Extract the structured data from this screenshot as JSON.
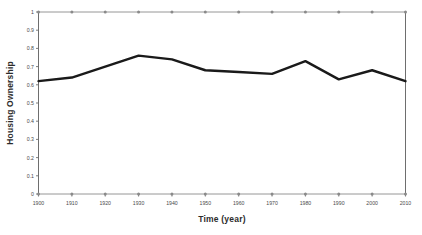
{
  "chart_data": {
    "type": "line",
    "title": "",
    "xlabel": "Time (year)",
    "ylabel": "Housing Ownership",
    "x": [
      1900,
      1910,
      1920,
      1930,
      1940,
      1950,
      1960,
      1970,
      1980,
      1990,
      2000,
      2010
    ],
    "xtick_labels": [
      "1900",
      "1910",
      "1920",
      "1930",
      "1940",
      "1950",
      "1960",
      "1970",
      "1980",
      "1990",
      "2000",
      "2010"
    ],
    "ytick_labels": [
      "0",
      "0.1",
      "0.2",
      "0.3",
      "0.4",
      "0.5",
      "0.6",
      "0.7",
      "0.8",
      "0.9",
      "1"
    ],
    "ytick_values": [
      0,
      0.1,
      0.2,
      0.3,
      0.4,
      0.5,
      0.6,
      0.7,
      0.8,
      0.9,
      1
    ],
    "xlim": [
      1900,
      2010
    ],
    "ylim": [
      0,
      1
    ],
    "grid": false,
    "legend": "none",
    "series": [
      {
        "name": "Housing Ownership",
        "color": "#1a1a1a",
        "values": [
          0.62,
          0.64,
          0.7,
          0.76,
          0.74,
          0.68,
          0.67,
          0.66,
          0.73,
          0.63,
          0.68,
          0.62
        ]
      },
      {
        "name": "upper-reference",
        "color": "#8a8a8a",
        "values": [
          1,
          1,
          1,
          1,
          1,
          1,
          1,
          1,
          1,
          1,
          1,
          1
        ]
      },
      {
        "name": "lower-reference",
        "color": "#8a8a8a",
        "values": [
          0,
          0,
          0,
          0,
          0,
          0,
          0,
          0,
          0,
          0,
          0,
          0
        ]
      }
    ]
  },
  "colors": {
    "series": "#1a1a1a",
    "reference": "#8a8a8a",
    "axis": "#6e6e6e",
    "text": "#2b2b2b",
    "tick_text": "#4a4a4a",
    "background": "#ffffff"
  }
}
